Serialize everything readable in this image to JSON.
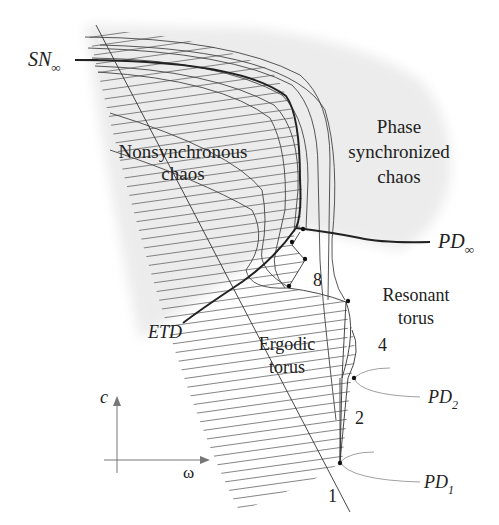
{
  "diagram": {
    "axes": {
      "vertical_label": "c",
      "horizontal_label": "ω"
    },
    "regions": {
      "nonsynchronous_chaos": [
        "Nonsynchronous",
        "chaos"
      ],
      "phase_synchronized_chaos": [
        "Phase",
        "synchronized",
        "chaos"
      ],
      "resonant_torus": [
        "Resonant",
        "torus"
      ],
      "ergodic_torus": [
        "Ergodic",
        "torus"
      ]
    },
    "curve_labels": {
      "sn_inf": {
        "main": "SN",
        "sub": "∞"
      },
      "pd_inf": {
        "main": "PD",
        "sub": "∞"
      },
      "etd": "ETD",
      "pd2": {
        "main": "PD",
        "sub": "2"
      },
      "pd1": {
        "main": "PD",
        "sub": "1"
      }
    },
    "period_labels": {
      "p1": "1",
      "p2": "2",
      "p4": "4",
      "p8": "8"
    },
    "colors": {
      "line": "#333333",
      "hatch": "#555555",
      "shade": "#ebebeb",
      "text": "#222222"
    }
  }
}
